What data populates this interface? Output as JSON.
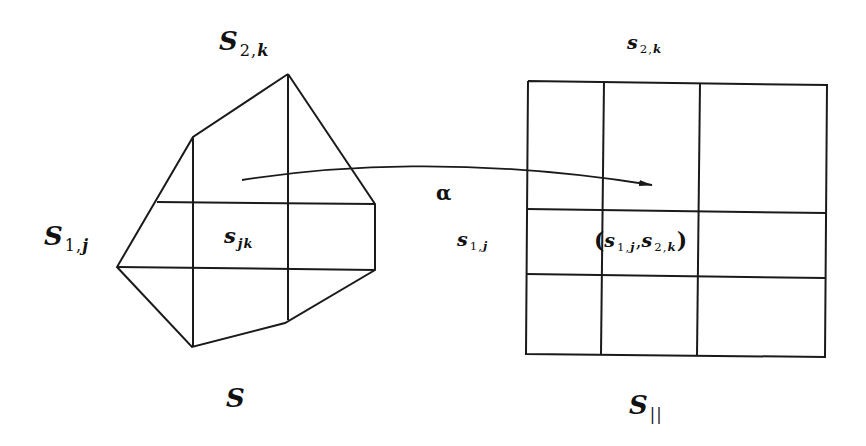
{
  "diagram": {
    "stroke_color": "#1a1a1a",
    "background": "#ffffff",
    "left_region": {
      "name": "S",
      "label": "S",
      "cell_label": {
        "base": "s",
        "sub": "jk"
      },
      "top_label": {
        "base": "S",
        "sub_pre": "2,",
        "sub_var": "k"
      },
      "side_label": {
        "base": "S",
        "sub_pre": "1,",
        "sub_var": "j"
      },
      "outline": [
        [
          288,
          74
        ],
        [
          375,
          204
        ],
        [
          375,
          270
        ],
        [
          285,
          323
        ],
        [
          192,
          347
        ],
        [
          117,
          267
        ],
        [
          193,
          137
        ],
        [
          288,
          74
        ]
      ],
      "grid_lines": [
        [
          [
            193,
            137
          ],
          [
            193,
            347
          ]
        ],
        [
          [
            288,
            74
          ],
          [
            288,
            320
          ]
        ],
        [
          [
            157,
            202
          ],
          [
            375,
            204
          ]
        ],
        [
          [
            117,
            267
          ],
          [
            375,
            270
          ]
        ]
      ]
    },
    "right_region": {
      "name": "S_||",
      "label": {
        "base": "S",
        "sub": "||"
      },
      "top_label": {
        "base": "s",
        "sub_pre": "2,",
        "sub_var": "k"
      },
      "side_label": {
        "base": "s",
        "sub_pre": "1,",
        "sub_var": "j"
      },
      "cell_label": {
        "open": "(",
        "a_base": "s",
        "a_sub_pre": "1,",
        "a_sub_var": "j",
        "sep": ",",
        "b_base": "s",
        "b_sub_pre": "2,",
        "b_sub_var": "k",
        "close": ")"
      },
      "outline": [
        [
          528,
          81
        ],
        [
          827,
          85
        ],
        [
          825,
          357
        ],
        [
          526,
          354
        ],
        [
          528,
          81
        ]
      ],
      "grid_lines": [
        [
          [
            604,
            81
          ],
          [
            601,
            354
          ]
        ],
        [
          [
            700,
            83
          ],
          [
            697,
            356
          ]
        ],
        [
          [
            527,
            209
          ],
          [
            826,
            213
          ]
        ],
        [
          [
            526,
            274
          ],
          [
            825,
            278
          ]
        ]
      ]
    },
    "mapping": {
      "symbol": "α",
      "arrow_path": "M 242 180 C 330 166, 470 156, 652 185",
      "arrow_tip": [
        652,
        185
      ]
    }
  }
}
